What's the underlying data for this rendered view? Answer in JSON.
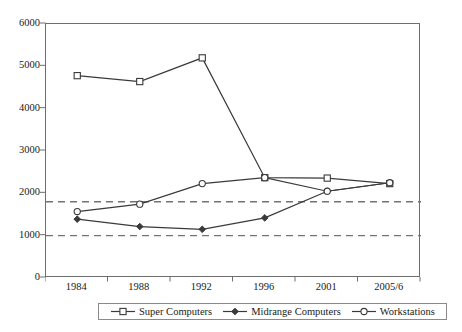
{
  "chart_data": {
    "type": "line",
    "title": "",
    "xlabel": "",
    "ylabel": "",
    "categories": [
      "1984",
      "1988",
      "1992",
      "1996",
      "2001",
      "2005/6"
    ],
    "ylim": [
      0,
      6000
    ],
    "yticks": [
      0,
      1000,
      2000,
      3000,
      4000,
      5000,
      6000
    ],
    "ytick_labels": [
      "0",
      "1000",
      "2000",
      "3000",
      "4000",
      "5000",
      "6000"
    ],
    "grid": false,
    "legend_position": "bottom",
    "series": [
      {
        "name": "Super Computers",
        "marker": "open-square",
        "color": "#3a3a3a",
        "values": [
          4780,
          4640,
          5200,
          2370,
          2360,
          2230
        ]
      },
      {
        "name": "Midrange Computers",
        "marker": "filled-diamond",
        "color": "#3a3a3a",
        "values": [
          1390,
          1215,
          1150,
          1420,
          2050,
          2250
        ]
      },
      {
        "name": "Workstations",
        "marker": "open-circle",
        "color": "#3a3a3a",
        "values": [
          1570,
          1745,
          2230,
          2370,
          2050,
          2250
        ]
      }
    ],
    "reference_lines": [
      {
        "name": "upper-reference",
        "value": 1800,
        "style": "dashed",
        "color": "#737373"
      },
      {
        "name": "lower-reference",
        "value": 1000,
        "style": "dashed",
        "color": "#737373"
      }
    ]
  }
}
